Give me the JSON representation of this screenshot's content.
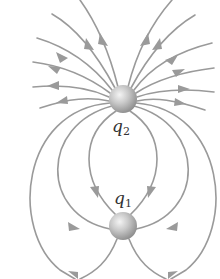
{
  "diagram": {
    "colors": {
      "background": "#ffffff",
      "field_line": "#9a9a9a",
      "charge_light": "#e6e6e6",
      "charge_dark": "#8e8e8e",
      "label": "#333333"
    },
    "charges": [
      {
        "id": "q2",
        "symbol": "q",
        "subscript": "2",
        "x": 123,
        "y": 99,
        "radius": 14,
        "role": "source (lines point outward)"
      },
      {
        "id": "q1",
        "symbol": "q",
        "subscript": "1",
        "x": 123,
        "y": 226,
        "radius": 14,
        "role": "sink (lines point inward)"
      }
    ]
  }
}
